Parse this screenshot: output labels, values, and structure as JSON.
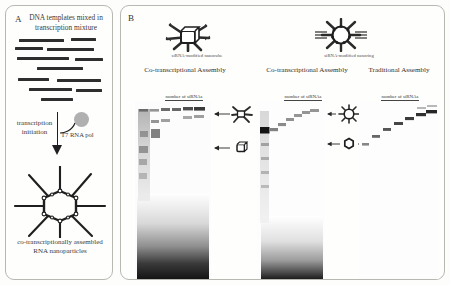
{
  "figure": {
    "panels": [
      {
        "letter": "A"
      },
      {
        "letter": "B"
      }
    ]
  },
  "panel_a": {
    "letter": "A",
    "title": "DNA templates mixed in transcription mixture",
    "transcription_label": "transcription initiation",
    "polymerase_label": "T7 RNA pol",
    "caption": "co-transcriptionally assembled RNA nanoparticles",
    "dna_templates": [
      {
        "x": 6,
        "y": 2,
        "w": 45
      },
      {
        "x": 58,
        "y": 1,
        "w": 25
      },
      {
        "x": 2,
        "y": 10,
        "w": 28
      },
      {
        "x": 34,
        "y": 11,
        "w": 47
      },
      {
        "x": 4,
        "y": 20,
        "w": 52
      },
      {
        "x": 62,
        "y": 21,
        "w": 28
      },
      {
        "x": 24,
        "y": 30,
        "w": 46
      },
      {
        "x": 5,
        "y": 41,
        "w": 31
      },
      {
        "x": 44,
        "y": 42,
        "w": 44
      },
      {
        "x": 16,
        "y": 51,
        "w": 43
      },
      {
        "x": 63,
        "y": 52,
        "w": 26
      },
      {
        "x": 28,
        "y": 61,
        "w": 32
      }
    ]
  },
  "panel_b": {
    "letter": "B",
    "icons": [
      {
        "name": "siRNA-modified nanocube",
        "caption": "siRNA-modified nanocube"
      },
      {
        "name": "siRNA-modified nanoring",
        "caption": "siRNA-modified nanoring"
      }
    ],
    "assembly_headers": [
      "Co-transcriptional Assembly",
      "Co-transcriptional Assembly",
      "Traditional Assembly"
    ],
    "gels": [
      {
        "id": "gel-nanocube-cotranscriptional",
        "axis_label": "number of siRNAs",
        "lanes": [
          "0",
          "1",
          "2",
          "3",
          "4",
          "5",
          "6"
        ]
      },
      {
        "id": "gel-nanoring-cotranscriptional",
        "axis_label": "number of siRNAs",
        "lanes": [
          "0",
          "1",
          "2",
          "3",
          "4",
          "5",
          "6"
        ]
      },
      {
        "id": "gel-nanoring-traditional",
        "axis_label": "number of siRNAs",
        "lanes": [
          "0",
          "1",
          "2",
          "3",
          "4",
          "5",
          "6"
        ]
      }
    ],
    "annotations": [
      {
        "name": "siRNA-modified-nanocube-arrow",
        "direction": "left"
      },
      {
        "name": "bare-nanocube-arrow",
        "direction": "left"
      },
      {
        "name": "siRNA-modified-nanoring-arrow",
        "direction": "both"
      },
      {
        "name": "bare-nanoring-arrow",
        "direction": "both"
      }
    ]
  },
  "colors": {
    "background": "#fdfdfb",
    "panel_border": "#b9b7b2",
    "ink": "#2a2a2a",
    "band": "#2a2a2a",
    "polymerase": "#b0b0b0"
  }
}
